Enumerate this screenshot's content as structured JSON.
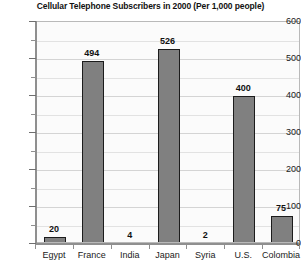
{
  "chart_data": {
    "type": "bar",
    "title": "Cellular Telephone Subscribers in 2000 (Per 1,000 people)",
    "xlabel": "",
    "ylabel": "",
    "categories": [
      "Egypt",
      "France",
      "India",
      "Japan",
      "Syria",
      "U.S.",
      "Colombia"
    ],
    "values": [
      20,
      494,
      4,
      526,
      2,
      400,
      75
    ],
    "value_labels": [
      "20",
      "494",
      "4",
      "526",
      "2",
      "400",
      "75"
    ],
    "ylim": [
      0,
      600
    ],
    "ytick_labels": [
      "0",
      "100",
      "200",
      "300",
      "400",
      "500",
      "600"
    ],
    "ytick_values": [
      0,
      100,
      200,
      300,
      400,
      500,
      600
    ],
    "yminor_values": [
      50,
      150,
      250,
      350,
      450,
      550
    ],
    "grid": true,
    "legend": false,
    "bar_color": "#808080",
    "bar_border_color": "#1c1c1c",
    "plot_background": "#fbfbfb",
    "gridline_color": "#e2e2e2",
    "axis_color": "#8f8f8f",
    "text_color": "#111111"
  }
}
